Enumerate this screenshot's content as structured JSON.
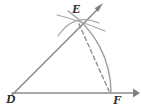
{
  "figure": {
    "kind": "geometry-construction-diagram",
    "background_color": "#ffffff",
    "stroke_color": "#8c8c8c",
    "arc_color": "#9a9a9a",
    "dash_color": "#8f8f8f",
    "label_color": "#2b2b2b",
    "width": 141,
    "height": 112
  },
  "labels": {
    "vertex": "D",
    "upper_point": "E",
    "base_point": "F"
  },
  "points": {
    "D": {
      "x": 12,
      "y": 95
    },
    "E": {
      "x": 78,
      "y": 20
    },
    "F": {
      "x": 110,
      "y": 93
    }
  },
  "rays": {
    "horizontal": {
      "name": "ray-DF",
      "from_x": 12,
      "from_y": 93,
      "to_x": 136,
      "to_y": 93
    },
    "slanted": {
      "name": "ray-DE",
      "from_x": 12,
      "from_y": 95,
      "to_x": 101,
      "to_y": 6
    }
  },
  "arc": {
    "name": "arc-E-to-F",
    "center_x": 12,
    "center_y": 94,
    "radius": 99,
    "start_x": 71,
    "start_y": 14,
    "end_x": 110,
    "end_y": 93
  },
  "chord": {
    "name": "dashed-chord-EF",
    "from_x": 79,
    "from_y": 24,
    "to_x": 109,
    "to_y": 90,
    "dash_pattern": "4 3"
  },
  "construction_marks": [
    {
      "name": "compass-arc-left",
      "d": "M 58 36 Q 74 12 99 23"
    },
    {
      "name": "compass-arc-right",
      "d": "M 57 15 Q 78 20 105 31"
    }
  ],
  "arrowheads": [
    {
      "name": "arrowhead-horizontal-right",
      "x": 136,
      "y": 93,
      "angle": 0
    },
    {
      "name": "arrowhead-slanted-upper",
      "x": 101,
      "y": 6,
      "angle": -45
    }
  ]
}
